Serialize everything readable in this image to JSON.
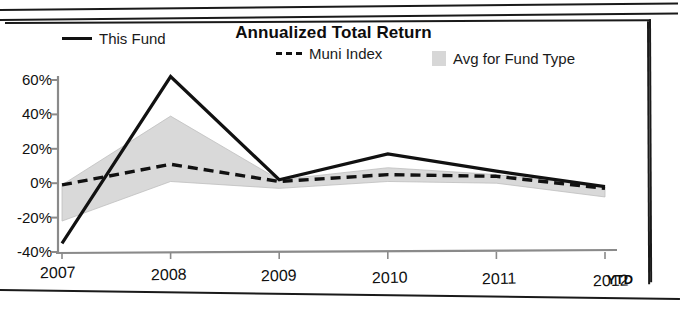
{
  "chart_data": {
    "type": "line",
    "title": "Annualized Total Return",
    "xlabel": "",
    "ylabel": "",
    "categories": [
      "2007",
      "2008",
      "2009",
      "2010",
      "2011",
      "2012"
    ],
    "x_axis_note": "YTD",
    "ylim": [
      -40,
      60
    ],
    "ytick_labels": [
      "60%",
      "40%",
      "20%",
      "0%",
      "-20%",
      "-40%"
    ],
    "ytick_values": [
      60,
      40,
      20,
      0,
      -20,
      -40
    ],
    "grid": false,
    "legend_position": "top",
    "series": [
      {
        "name": "This Fund",
        "style": "solid",
        "color": "#111111",
        "values": [
          -35,
          62,
          2,
          17,
          7,
          -2
        ]
      },
      {
        "name": "Muni Index",
        "style": "dashed",
        "color": "#111111",
        "values": [
          -1,
          11,
          1,
          5,
          4,
          -3
        ]
      },
      {
        "name": "Avg for Fund Type",
        "style": "band",
        "color": "#d7d7d7",
        "upper": [
          -1,
          39,
          2,
          9,
          5,
          -2
        ],
        "lower": [
          -22,
          1,
          -3,
          1,
          0,
          -8
        ]
      }
    ]
  },
  "chart": {
    "title": "Annualized Total Return",
    "legend": [
      {
        "label": "This Fund",
        "marker": "solid-line-key"
      },
      {
        "label": "Muni Index",
        "marker": "dashed-line-key"
      },
      {
        "label": "Avg for Fund Type",
        "marker": "gray-swatch-key"
      }
    ],
    "y_labels": [
      "60%",
      "40%",
      "20%",
      "0%",
      "-20%",
      "-40%"
    ],
    "x_labels": [
      "2007",
      "2008",
      "2009",
      "2010",
      "2011",
      "2012"
    ],
    "ytd_label": "YTD"
  },
  "colors": {
    "ink": "#111111",
    "band": "#d7d7d7",
    "axis": "#8a8a8a"
  }
}
